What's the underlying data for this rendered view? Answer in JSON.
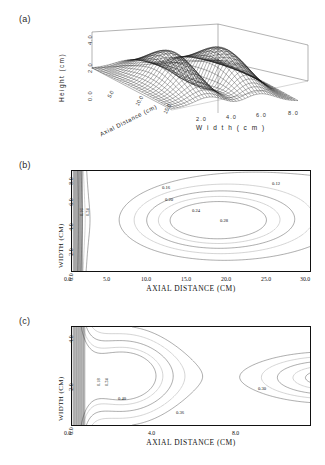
{
  "figure": {
    "panels": [
      {
        "tag": "(a)",
        "type": "surface3d"
      },
      {
        "tag": "(b)",
        "type": "contour"
      },
      {
        "tag": "(c)",
        "type": "contour"
      }
    ]
  },
  "panel_a": {
    "tag": "(a)",
    "z_axis_label": "Height (cm)",
    "z_ticks": [
      "4.0",
      "2.0",
      "0.0"
    ],
    "x_axis_label": "W i d t h   ( c m )",
    "x_ticks": [
      "2.0",
      "4.0",
      "6.0",
      "8.0"
    ],
    "y_axis_label": "Axial Distance (cm)",
    "y_ticks": [
      "5.0",
      "10.0",
      "15.0"
    ]
  },
  "panel_b": {
    "tag": "(b)",
    "x_axis_label": "AXIAL DISTANCE (CM)",
    "y_axis_label": "WIDTH (CM)",
    "x_ticks": [
      "0.0",
      "5.0",
      "10.0",
      "15.0",
      "20.0",
      "25.0",
      "30.0"
    ],
    "y_ticks": [
      "0.0",
      "2.0",
      "4.0",
      "6.0",
      "8.0"
    ],
    "contour_labels": [
      "0.16",
      "0.20",
      "0.24",
      "0.28",
      "0.12",
      "0.16",
      "0.24"
    ]
  },
  "panel_c": {
    "tag": "(c)",
    "x_axis_label": "AXIAL DISTANCE (CM)",
    "y_axis_label": "WIDTH (CM)",
    "x_ticks": [
      "0.0",
      "4.0",
      "8.0"
    ],
    "y_ticks": [
      "0.0",
      "2.0",
      "4.0"
    ],
    "contour_labels": [
      "0.18",
      "0.24",
      "0.40",
      "0.36",
      "0.30"
    ]
  },
  "chart_data": [
    {
      "type": "surface",
      "panel": "(a)",
      "title": "",
      "xlabel": "Width (cm)",
      "ylabel": "Axial Distance (cm)",
      "zlabel": "Height (cm)",
      "xlim": [
        0.0,
        8.0
      ],
      "ylim": [
        0.0,
        20.0
      ],
      "zlim": [
        0.0,
        4.0
      ],
      "xticks": [
        2.0,
        4.0,
        6.0,
        8.0
      ],
      "yticks": [
        5.0,
        10.0,
        15.0
      ],
      "zticks": [
        0.0,
        2.0,
        4.0
      ],
      "grid": false,
      "description": "Wireframe mesh of a bimodal ridge surface; two elongated crests running along the axial direction with a deep saddle valley between them.",
      "mesh": {
        "nx": 44,
        "ny": 30,
        "peak_height": 3.6,
        "saddle_height": 1.1
      }
    },
    {
      "type": "contour",
      "panel": "(b)",
      "title": "",
      "xlabel": "AXIAL DISTANCE (CM)",
      "ylabel": "WIDTH (CM)",
      "xlim": [
        0.0,
        30.0
      ],
      "ylim": [
        0.0,
        8.0
      ],
      "xticks": [
        0.0,
        5.0,
        10.0,
        15.0,
        20.0,
        25.0,
        30.0
      ],
      "yticks": [
        0.0,
        2.0,
        4.0,
        6.0,
        8.0
      ],
      "grid": false,
      "levels": [
        0.12,
        0.16,
        0.2,
        0.24,
        0.28
      ],
      "labeled_levels": [
        "0.12",
        "0.16",
        "0.20",
        "0.24",
        "0.28"
      ],
      "maximum": {
        "x": 18.0,
        "y": 4.0,
        "value": 0.28
      },
      "description": "Contour map with dense packed contours at the left inlet edge and a closed 0.28 maximum centred near x=18 cm, y=4 cm."
    },
    {
      "type": "contour",
      "panel": "(c)",
      "title": "",
      "xlabel": "AXIAL DISTANCE (CM)",
      "ylabel": "WIDTH (CM)",
      "xlim": [
        0.0,
        11.5
      ],
      "ylim": [
        0.0,
        4.0
      ],
      "xticks": [
        0.0,
        4.0,
        8.0
      ],
      "yticks": [
        0.0,
        2.0,
        4.0
      ],
      "grid": false,
      "levels": [
        0.18,
        0.24,
        0.3,
        0.36,
        0.4
      ],
      "labeled_levels": [
        "0.18",
        "0.24",
        "0.40",
        "0.36",
        "0.30"
      ],
      "description": "Contour map with tightly packed contours at the left edge, a forward-bulging 0.40 contour near x=3 cm and a re-entrant lobe entering from the right at mid width."
    }
  ]
}
